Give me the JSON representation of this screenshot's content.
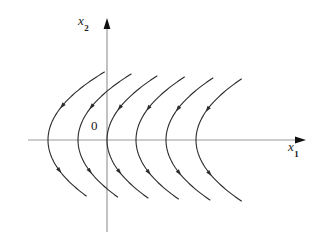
{
  "figure": {
    "background_color": "#ffffff",
    "width": 324,
    "height": 240
  },
  "axes": {
    "origin_label": "0",
    "x_axis": {
      "label_base": "x",
      "label_sub": "1",
      "color": "#9a9a9a",
      "arrow_color": "#111111",
      "y_pixel": 140,
      "x_start": 28,
      "x_end": 306
    },
    "y_axis": {
      "label_base": "x",
      "label_sub": "2",
      "color": "#9a9a9a",
      "arrow_color": "#111111",
      "x_pixel": 107,
      "y_start": 232,
      "y_end": 18
    }
  },
  "chart_data": {
    "type": "line",
    "xlabel": "x1",
    "ylabel": "x2",
    "grid": false,
    "legend": null,
    "curve_color": "#2b2b2b",
    "curve_width": 1.1,
    "series": [
      {
        "name": "trajectory-1",
        "vertex_x": 48,
        "vertex_y": 140,
        "width": 0.0122,
        "top_end_y": 72,
        "bottom_end_y": 196,
        "arrow_top_t": 0.5,
        "arrow_bottom_t": 0.55
      },
      {
        "name": "trajectory-2",
        "vertex_x": 78,
        "vertex_y": 140,
        "width": 0.0122,
        "top_end_y": 74,
        "bottom_end_y": 197,
        "arrow_top_t": 0.5,
        "arrow_bottom_t": 0.55
      },
      {
        "name": "trajectory-3",
        "vertex_x": 107,
        "vertex_y": 140,
        "width": 0.0122,
        "top_end_y": 76,
        "bottom_end_y": 198,
        "arrow_top_t": 0.5,
        "arrow_bottom_t": 0.55
      },
      {
        "name": "trajectory-4",
        "vertex_x": 136,
        "vertex_y": 140,
        "width": 0.0122,
        "top_end_y": 77,
        "bottom_end_y": 199,
        "arrow_top_t": 0.5,
        "arrow_bottom_t": 0.55
      },
      {
        "name": "trajectory-5",
        "vertex_x": 166,
        "vertex_y": 140,
        "width": 0.0122,
        "top_end_y": 78,
        "bottom_end_y": 200,
        "arrow_top_t": 0.5,
        "arrow_bottom_t": 0.55
      },
      {
        "name": "trajectory-6",
        "vertex_x": 196,
        "vertex_y": 140,
        "width": 0.0122,
        "top_end_y": 79,
        "bottom_end_y": 201,
        "arrow_top_t": 0.5,
        "arrow_bottom_t": 0.55
      }
    ],
    "flow_direction": {
      "upper_branch": "toward-vertex",
      "lower_branch": "away-from-vertex"
    }
  }
}
